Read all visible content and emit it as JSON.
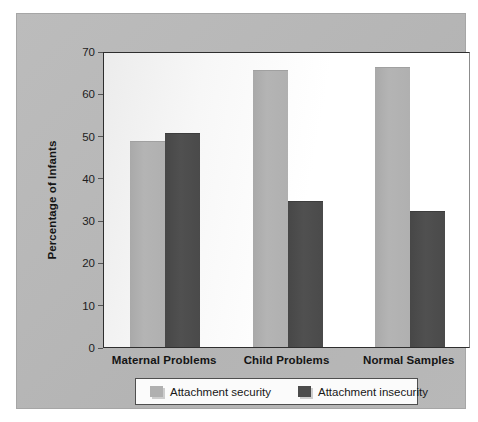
{
  "chart_data": {
    "type": "bar",
    "title": "",
    "xlabel": "",
    "ylabel": "Percentage of Infants",
    "ylim": [
      0,
      70
    ],
    "yticks": [
      0,
      10,
      20,
      30,
      40,
      50,
      60,
      70
    ],
    "grid": false,
    "legend_position": "bottom",
    "categories": [
      "Maternal Problems",
      "Child Problems",
      "Normal Samples"
    ],
    "series": [
      {
        "name": "Attachment security",
        "color": "#b0b0b0",
        "values": [
          48.7,
          65.5,
          66.3
        ]
      },
      {
        "name": "Attachment insecurity",
        "color": "#4c4c4c",
        "values": [
          50.7,
          34.5,
          32.2
        ]
      }
    ]
  },
  "colors": {
    "panel": "#b9b9b9",
    "plot_background": "#ffffff",
    "axis": "#2e2e2e",
    "series_light": "#b0b0b0",
    "series_dark": "#4c4c4c",
    "legend_border": "#4f4f4f"
  }
}
